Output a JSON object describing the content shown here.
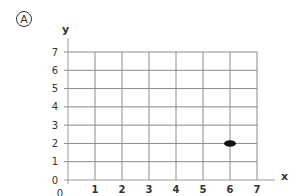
{
  "panel_label": "A",
  "chart_data": {
    "type": "scatter",
    "title": "",
    "xlabel": "x",
    "ylabel": "y",
    "xlim": [
      0,
      7
    ],
    "ylim": [
      0,
      7
    ],
    "x_ticks": [
      "0",
      "1",
      "2",
      "3",
      "4",
      "5",
      "6",
      "7"
    ],
    "y_ticks": [
      "0",
      "1",
      "2",
      "3",
      "4",
      "5",
      "6",
      "7"
    ],
    "grid": true,
    "points": [
      {
        "x": 6,
        "y": 2
      }
    ]
  }
}
